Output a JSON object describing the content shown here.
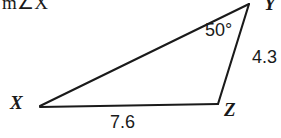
{
  "prompt": {
    "text": "m∠X"
  },
  "figure": {
    "shape_name": "triangle",
    "vertices": {
      "x": {
        "label": "X",
        "cx": 40,
        "cy": 106
      },
      "y": {
        "label": "Y",
        "cx": 249,
        "cy": 4
      },
      "z": {
        "label": "Z",
        "cx": 218,
        "cy": 104
      }
    },
    "angles": [
      {
        "at": "Y",
        "label": "50°",
        "value": 50,
        "unit": "degrees"
      }
    ],
    "sides": [
      {
        "from": "Y",
        "to": "Z",
        "label": "4.3",
        "value": 4.3
      },
      {
        "from": "X",
        "to": "Z",
        "label": "7.6",
        "value": 7.6
      }
    ],
    "stroke_color": "#1a1a1a",
    "fill_color": "#ffffff",
    "background_color": "#ffffff"
  }
}
